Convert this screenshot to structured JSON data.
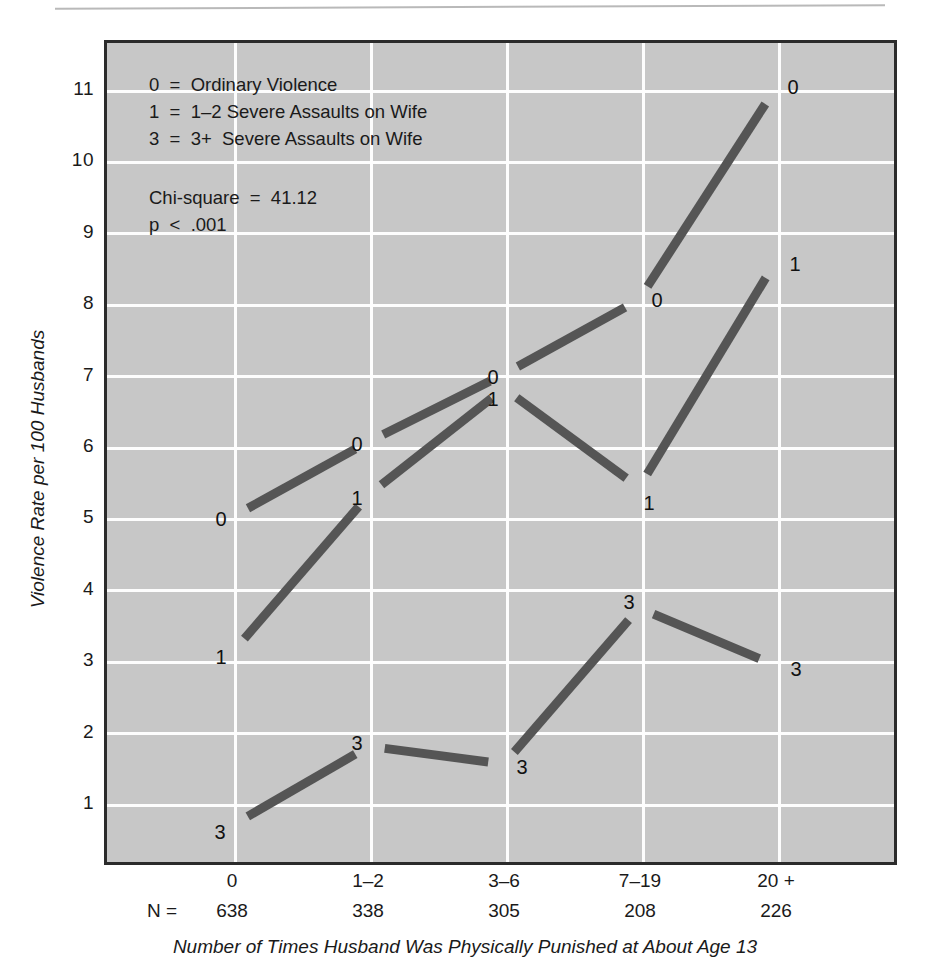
{
  "figure": {
    "legend_lines": [
      "0  =  Ordinary Violence",
      "1  =  1–2 Severe Assaults on Wife",
      "3  =  3+  Severe Assaults on Wife"
    ],
    "stats_lines": [
      "Chi-square  =  41.12",
      "p  <  .001"
    ],
    "n_prefix": "N  ="
  },
  "chart_data": {
    "type": "line",
    "title": "",
    "xlabel": "Number of Times Husband Was Physically Punished at About Age 13",
    "ylabel": "Violence Rate per 100 Husbands",
    "categories": [
      "0",
      "1–2",
      "3–6",
      "7–19",
      "20 +"
    ],
    "group_sizes": [
      638,
      338,
      305,
      208,
      226
    ],
    "ylim": [
      0.3,
      11.6
    ],
    "yticks": [
      11,
      10,
      9,
      8,
      7,
      6,
      5,
      4,
      3,
      2,
      1
    ],
    "grid": true,
    "legend_position": "inside-top-left",
    "series": [
      {
        "name": "0",
        "label": "Ordinary Violence",
        "marker_label": "0",
        "values": [
          5.0,
          6.05,
          7.0,
          8.05,
          11.0
        ]
      },
      {
        "name": "1",
        "label": "1–2 Severe Assaults on Wife",
        "marker_label": "1",
        "values": [
          3.1,
          5.3,
          6.8,
          5.4,
          8.55
        ]
      },
      {
        "name": "3",
        "label": "3+ Severe Assaults on Wife",
        "marker_label": "3",
        "values": [
          0.65,
          1.75,
          1.5,
          3.7,
          2.9
        ]
      }
    ],
    "annotations": {
      "chi_square": "41.12",
      "p_value": "< .001"
    }
  }
}
